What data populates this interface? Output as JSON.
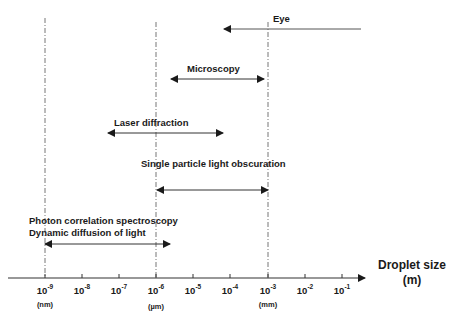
{
  "diagram": {
    "axis": {
      "title_line1": "Droplet size",
      "title_line2": "(m)",
      "ticks": [
        {
          "base": "10",
          "exp": "-9",
          "x": 45
        },
        {
          "base": "10",
          "exp": "-8",
          "x": 82
        },
        {
          "base": "10",
          "exp": "-7",
          "x": 119
        },
        {
          "base": "10",
          "exp": "-6",
          "x": 156
        },
        {
          "base": "10",
          "exp": "-5",
          "x": 193
        },
        {
          "base": "10",
          "exp": "-4",
          "x": 230
        },
        {
          "base": "10",
          "exp": "-3",
          "x": 268
        },
        {
          "base": "10",
          "exp": "-2",
          "x": 305
        },
        {
          "base": "10",
          "exp": "-1",
          "x": 342
        }
      ],
      "units": [
        {
          "label": "(nm)",
          "x": 45
        },
        {
          "label": "(µm)",
          "x": 156
        },
        {
          "label": "(mm)",
          "x": 268
        }
      ]
    },
    "methods": [
      {
        "name": "eye",
        "label": "Eye",
        "range": "> 10^-4 m (open-ended)"
      },
      {
        "name": "microscopy",
        "label": "Microscopy",
        "range": "~2×10^-6 to 10^-3 m"
      },
      {
        "name": "laser-diffraction",
        "label": "Laser diffraction",
        "range": "~5×10^-8 to 5×10^-5 m"
      },
      {
        "name": "single-particle",
        "label": "Single particle light obscuration",
        "range": "10^-6 to 10^-3 m"
      },
      {
        "name": "photon-correlation",
        "label_line1": "Photon correlation spectroscopy",
        "label_line2": "Dynamic diffusion of light",
        "range": "10^-9 to ~3×10^-6 m"
      }
    ]
  }
}
